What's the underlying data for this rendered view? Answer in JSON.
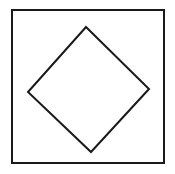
{
  "figure": {
    "background_color": "#ffffff",
    "canvas": {
      "width": 175,
      "height": 174
    },
    "shapes": [
      {
        "id": "outer-square",
        "name": "outer-square",
        "type": "rect",
        "label": "Outer square",
        "stroke_color": "#1a1a1a",
        "fill_color": "#ffffff",
        "stroke_width": 2,
        "x": 12,
        "y": 10,
        "width": 152,
        "height": 153,
        "points": "12,10 164,10 164,163 12,163"
      },
      {
        "id": "inner-diamond",
        "name": "inner-diamond",
        "type": "polygon",
        "label": "Inner diamond",
        "stroke_color": "#1a1a1a",
        "fill_color": "#ffffff",
        "stroke_width": 2,
        "points": "86,27 149,89 91,152 28,92",
        "vertices": [
          {
            "name": "top-vertex",
            "x": 86,
            "y": 27
          },
          {
            "name": "right-vertex",
            "x": 149,
            "y": 89
          },
          {
            "name": "bottom-vertex",
            "x": 91,
            "y": 152
          },
          {
            "name": "left-vertex",
            "x": 28,
            "y": 92
          }
        ]
      }
    ]
  }
}
